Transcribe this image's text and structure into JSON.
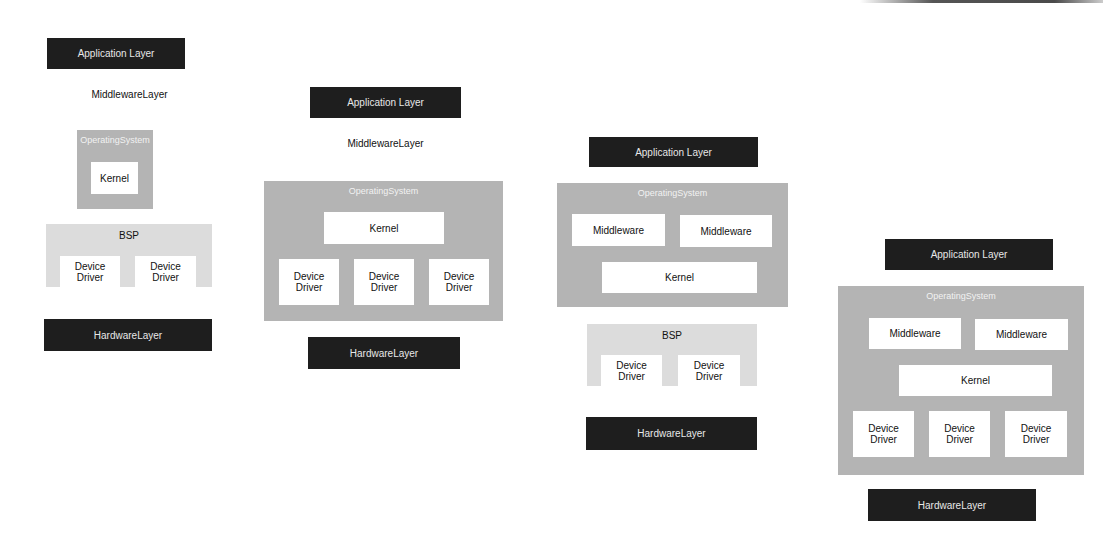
{
  "colors": {
    "dark_layer": "#1e1e1e",
    "os_container": "#b4b4b4",
    "bsp_container": "#dcdcdc",
    "inner_box": "#ffffff"
  },
  "diagrams": [
    {
      "application_layer": "Application Layer",
      "middleware_layer": "MiddlewareLayer",
      "operating_system": {
        "title": "OperatingSystem",
        "kernel": "Kernel"
      },
      "bsp": {
        "title": "BSP",
        "device_drivers": [
          "Device Driver",
          "Device Driver"
        ]
      },
      "hardware_layer": "HardwareLayer"
    },
    {
      "application_layer": "Application Layer",
      "middleware_layer": "MiddlewareLayer",
      "operating_system": {
        "title": "OperatingSystem",
        "kernel": "Kernel",
        "device_drivers": [
          "Device Driver",
          "Device Driver",
          "Device Driver"
        ]
      },
      "hardware_layer": "HardwareLayer"
    },
    {
      "application_layer": "Application Layer",
      "operating_system": {
        "title": "OperatingSystem",
        "middleware": [
          "Middleware",
          "Middleware"
        ],
        "kernel": "Kernel"
      },
      "bsp": {
        "title": "BSP",
        "device_drivers": [
          "Device Driver",
          "Device Driver"
        ]
      },
      "hardware_layer": "HardwareLayer"
    },
    {
      "application_layer": "Application Layer",
      "operating_system": {
        "title": "OperatingSystem",
        "middleware": [
          "Middleware",
          "Middleware"
        ],
        "kernel": "Kernel",
        "device_drivers": [
          "Device Driver",
          "Device Driver",
          "Device Driver"
        ]
      },
      "hardware_layer": "HardwareLayer"
    }
  ]
}
